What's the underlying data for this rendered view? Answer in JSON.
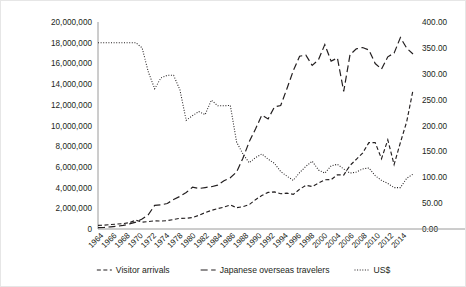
{
  "chart_data": {
    "type": "line",
    "title": "",
    "subtitle": "",
    "xlabel": "",
    "ylabel": "",
    "y2label": "",
    "grid": false,
    "legend_position": "bottom",
    "x": [
      1964,
      1965,
      1966,
      1967,
      1968,
      1969,
      1970,
      1971,
      1972,
      1973,
      1974,
      1975,
      1976,
      1977,
      1978,
      1979,
      1980,
      1981,
      1982,
      1983,
      1984,
      1985,
      1986,
      1987,
      1988,
      1989,
      1990,
      1991,
      1992,
      1993,
      1994,
      1995,
      1996,
      1997,
      1998,
      1999,
      2000,
      2001,
      2002,
      2003,
      2004,
      2005,
      2006,
      2007,
      2008,
      2009,
      2010,
      2011,
      2012,
      2013,
      2014
    ],
    "xtick_labels": [
      "1964",
      "1966",
      "1968",
      "1970",
      "1972",
      "1974",
      "1978",
      "1980",
      "1982",
      "1984",
      "1986",
      "1988",
      "1990",
      "1992",
      "1994",
      "1996",
      "1998",
      "2000",
      "2004",
      "2006",
      "2008",
      "2010",
      "2012",
      "2014"
    ],
    "ytick_labels": [
      "0",
      "2,000,000",
      "4,000,000",
      "6,000,000",
      "8,000,000",
      "10,000,000",
      "12,000,000",
      "14,000,000",
      "16,000,000",
      "18,000,000",
      "20,000,000"
    ],
    "y2tick_labels": [
      "0.00",
      "50.00",
      "100.00",
      "150.00",
      "200.00",
      "250.00",
      "300.00",
      "350.00",
      "400.00"
    ],
    "ylim": [
      0,
      20000000
    ],
    "y2lim": [
      0,
      400
    ],
    "ytick_step": 2000000,
    "y2tick_step": 50,
    "series": [
      {
        "name": "Visitor arrivals",
        "axis": "left",
        "dash": "4,2.5",
        "width": 1.15,
        "values": [
          352000,
          366000,
          433000,
          477000,
          519000,
          609000,
          854000,
          661000,
          724000,
          785000,
          764000,
          812000,
          915000,
          1030000,
          1039000,
          1113000,
          1317000,
          1583000,
          1793000,
          1968000,
          2110000,
          2327000,
          2061000,
          2155000,
          2355000,
          2835000,
          3236000,
          3533000,
          3582000,
          3410000,
          3468000,
          3345000,
          3837000,
          4218000,
          4106000,
          4438000,
          4757000,
          4772000,
          5239000,
          5212000,
          6138000,
          6728000,
          7334000,
          8347000,
          8351000,
          6790000,
          8611000,
          6219000,
          8358000,
          10364000,
          13413000
        ]
      },
      {
        "name": "Japanese overseas travelers",
        "axis": "left",
        "dash": "7,3.5",
        "width": 1.2,
        "values": [
          128000,
          159000,
          212000,
          268000,
          344000,
          493000,
          663000,
          961000,
          1392000,
          2289000,
          2336000,
          2466000,
          2853000,
          3151000,
          3525000,
          4038000,
          3909000,
          4006000,
          4086000,
          4232000,
          4659000,
          4948000,
          5516000,
          6829000,
          8427000,
          9663000,
          10997000,
          10634000,
          11791000,
          11934000,
          13579000,
          15298000,
          16695000,
          16803000,
          15806000,
          16358000,
          17819000,
          16216000,
          16523000,
          13296000,
          16831000,
          17404000,
          17535000,
          17295000,
          15987000,
          15446000,
          16637000,
          16994000,
          18491000,
          17473000,
          16903000
        ]
      },
      {
        "name": "US$",
        "axis": "right",
        "dash": "1,1.6",
        "width": 1.05,
        "values": [
          360,
          360,
          360,
          360,
          360,
          360,
          360,
          350,
          303,
          271,
          292,
          297,
          297,
          269,
          210,
          219,
          227,
          221,
          249,
          238,
          238,
          239,
          168,
          145,
          128,
          138,
          145,
          135,
          127,
          111,
          102,
          94,
          109,
          121,
          131,
          114,
          108,
          122,
          125,
          116,
          108,
          110,
          116,
          118,
          103,
          94,
          88,
          80,
          80,
          98,
          106
        ]
      }
    ]
  },
  "legend": {
    "items": [
      {
        "label": "Visitor arrivals",
        "dash": "4,2.5"
      },
      {
        "label": "Japanese overseas travelers",
        "dash": "7,3.5"
      },
      {
        "label": "US$",
        "dash": "1,1.6"
      }
    ]
  }
}
